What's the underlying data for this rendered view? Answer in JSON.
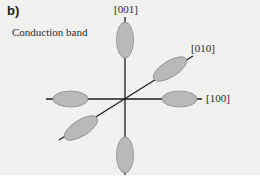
{
  "figure": {
    "panel_label": "b)",
    "title": "Conduction band",
    "axes": [
      {
        "label": "[001]",
        "direction": "vertical"
      },
      {
        "label": "[010]",
        "direction": "diagonal"
      },
      {
        "label": "[100]",
        "direction": "horizontal"
      }
    ],
    "valleys": [
      {
        "name": "valley-plus-001",
        "axis": "[001]"
      },
      {
        "name": "valley-minus-001",
        "axis": "[001]"
      },
      {
        "name": "valley-plus-100",
        "axis": "[100]"
      },
      {
        "name": "valley-minus-100",
        "axis": "[100]"
      },
      {
        "name": "valley-plus-010",
        "axis": "[010]"
      },
      {
        "name": "valley-minus-010",
        "axis": "[010]"
      }
    ],
    "colors": {
      "background": "#f1f1f0",
      "ellipse_fill": "#b9b9b9",
      "ellipse_stroke": "#8a8a8a",
      "axis_line": "#1e1e1e"
    }
  }
}
